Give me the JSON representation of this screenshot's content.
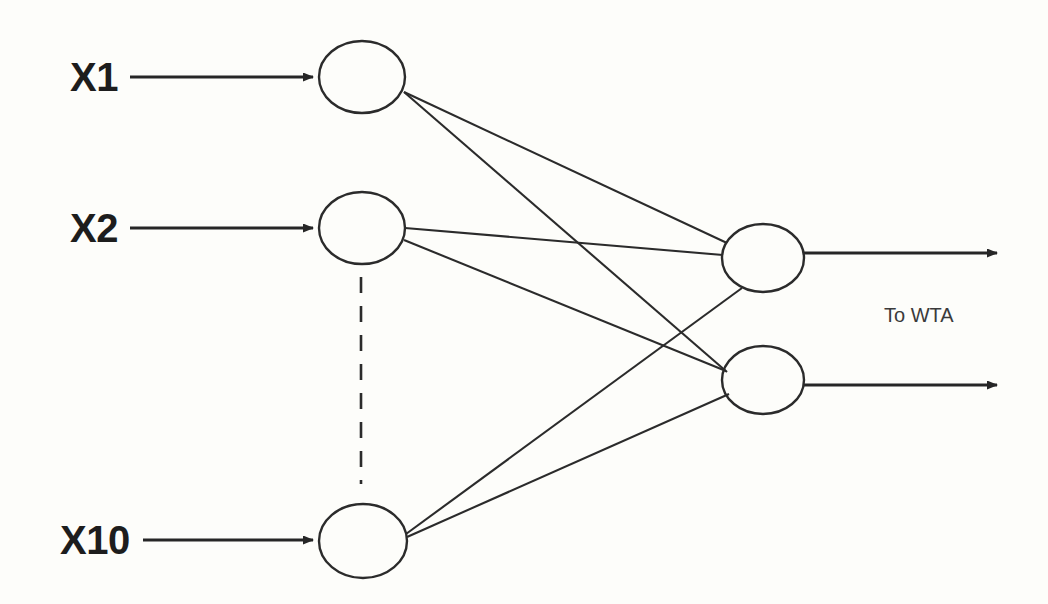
{
  "diagram": {
    "background_color": "#fdfdfa",
    "stroke_color": "#2b2b2b",
    "input_labels": [
      {
        "text": "X1",
        "x": 70,
        "y": 57
      },
      {
        "text": "X2",
        "x": 70,
        "y": 208
      },
      {
        "text": "X10",
        "x": 60,
        "y": 520
      }
    ],
    "output_annotation": {
      "text": "To WTA",
      "x": 884,
      "y": 305
    },
    "input_nodes": [
      {
        "name": "input-node-x1",
        "cx": 362,
        "cy": 77,
        "rx": 43,
        "ry": 36
      },
      {
        "name": "input-node-x2",
        "cx": 362,
        "cy": 228,
        "rx": 43,
        "ry": 36
      },
      {
        "name": "input-node-x10",
        "cx": 363,
        "cy": 541,
        "rx": 44,
        "ry": 37
      }
    ],
    "output_nodes": [
      {
        "name": "output-node-1",
        "cx": 763,
        "cy": 258,
        "rx": 41,
        "ry": 34
      },
      {
        "name": "output-node-2",
        "cx": 763,
        "cy": 380,
        "rx": 41,
        "ry": 34
      }
    ],
    "input_arrows": [
      {
        "name": "input-arrow-x1",
        "x1": 130,
        "y1": 77,
        "x2": 313,
        "y2": 77
      },
      {
        "name": "input-arrow-x2",
        "x1": 130,
        "y1": 228,
        "x2": 313,
        "y2": 228
      },
      {
        "name": "input-arrow-x10",
        "x1": 143,
        "y1": 540,
        "x2": 313,
        "y2": 540
      }
    ],
    "output_arrows": [
      {
        "name": "output-arrow-1",
        "x1": 804,
        "y1": 253,
        "x2": 997,
        "y2": 253
      },
      {
        "name": "output-arrow-2",
        "x1": 804,
        "y1": 385,
        "x2": 997,
        "y2": 385
      }
    ],
    "connections": [
      {
        "name": "synapse-x1-to-out1",
        "x1": 404,
        "y1": 92,
        "x2": 727,
        "y2": 243
      },
      {
        "name": "synapse-x1-to-out2",
        "x1": 404,
        "y1": 92,
        "x2": 727,
        "y2": 372
      },
      {
        "name": "synapse-x2-to-out1",
        "x1": 405,
        "y1": 228,
        "x2": 723,
        "y2": 255
      },
      {
        "name": "synapse-x2-to-out2",
        "x1": 404,
        "y1": 240,
        "x2": 726,
        "y2": 371
      },
      {
        "name": "synapse-x10-to-out1",
        "x1": 406,
        "y1": 534,
        "x2": 742,
        "y2": 288
      },
      {
        "name": "synapse-x10-to-out2",
        "x1": 407,
        "y1": 537,
        "x2": 729,
        "y2": 394
      }
    ],
    "ellipsis": {
      "name": "vertical-ellipsis-dashes",
      "x": 361,
      "y1": 277,
      "y2": 484
    }
  },
  "graph_data": {
    "type": "diagram",
    "layers": [
      {
        "name": "input",
        "node_count": 3,
        "represents": 10,
        "labels": [
          "X1",
          "X2",
          "X10"
        ]
      },
      {
        "name": "output",
        "node_count": 2,
        "labels": [
          "",
          ""
        ]
      }
    ],
    "fully_connected": true,
    "edge_count": 6,
    "destination": "To WTA"
  }
}
